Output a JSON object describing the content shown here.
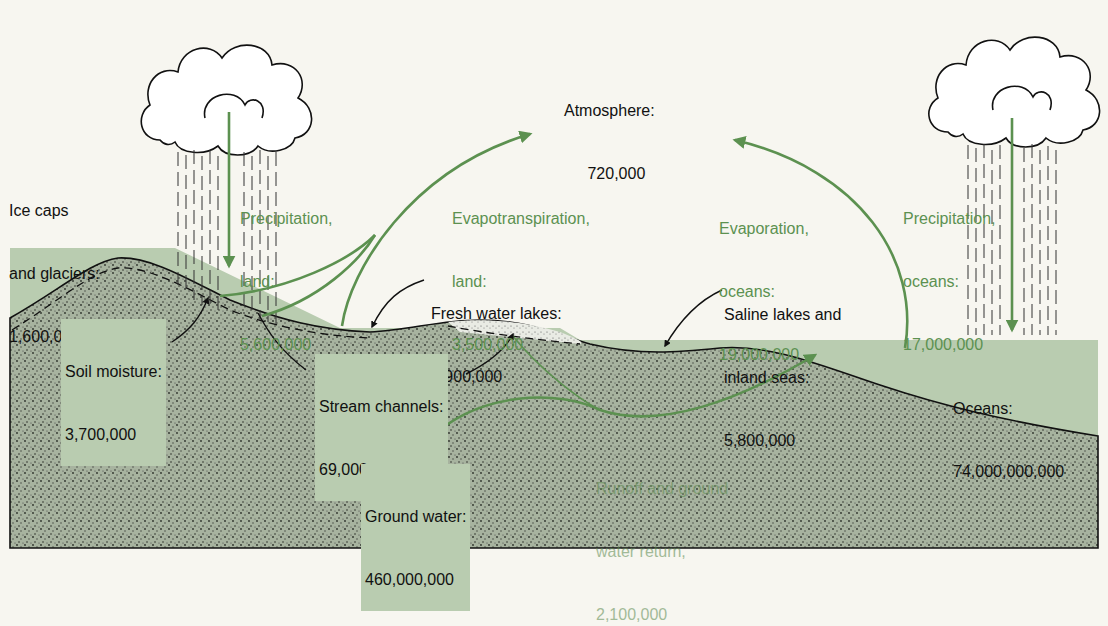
{
  "diagram": {
    "colors": {
      "background": "#f7f6f0",
      "water": "#b9ccb0",
      "ground": "#9faa98",
      "flow_arrow": "#5c9150",
      "outline": "#111111"
    },
    "reservoirs": {
      "atmosphere": {
        "name": "Atmosphere:",
        "value": "720,000"
      },
      "ice_caps": {
        "name_line1": "Ice caps",
        "name_line2": "and glaciers:",
        "value": "1,600,000,000"
      },
      "fresh_lakes": {
        "name": "Fresh water lakes:",
        "value": "6,900,000"
      },
      "saline_lakes": {
        "name_line1": "Saline lakes and",
        "name_line2": "inland seas:",
        "value": "5,800,000"
      },
      "soil_moisture": {
        "name": "Soil moisture:",
        "value": "3,700,000"
      },
      "stream_channels": {
        "name": "Stream channels:",
        "value": "69,000"
      },
      "ground_water": {
        "name": "Ground water:",
        "value": "460,000,000"
      },
      "oceans": {
        "name": "Oceans:",
        "value": "74,000,000,000"
      }
    },
    "fluxes": {
      "precip_land": {
        "line1": "Precipitation,",
        "line2": "land:",
        "value": "5,600,000"
      },
      "evapotranspiration_land": {
        "line1": "Evapotranspiration,",
        "line2": "land:",
        "value": "3,500,000"
      },
      "evaporation_oceans": {
        "line1": "Evaporation,",
        "line2": "oceans:",
        "value": "19,000,000"
      },
      "precip_oceans": {
        "line1": "Precipitation,",
        "line2": "oceans:",
        "value": "17,000,000"
      },
      "runoff": {
        "line1": "Runoff and ground",
        "line2": "water return,",
        "value": "2,100,000"
      }
    },
    "icons": [
      "cloud-icon-land",
      "cloud-icon-ocean",
      "rain-icon-land",
      "rain-icon-ocean"
    ]
  }
}
